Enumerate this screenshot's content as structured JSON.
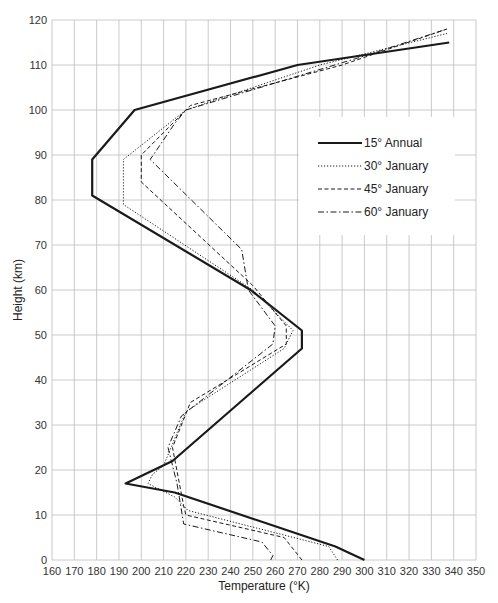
{
  "chart_data": {
    "type": "line",
    "title": "",
    "xlabel": "Temperature (°K)",
    "ylabel": "Height (km)",
    "xlim": [
      160,
      350
    ],
    "ylim": [
      0,
      120
    ],
    "x_ticks": [
      160,
      170,
      180,
      190,
      200,
      210,
      220,
      230,
      240,
      250,
      260,
      270,
      280,
      290,
      300,
      310,
      320,
      330,
      340,
      350
    ],
    "y_ticks": [
      0,
      10,
      20,
      30,
      40,
      50,
      60,
      70,
      80,
      90,
      100,
      110,
      120
    ],
    "grid": true,
    "legend_position": "upper right (inside plot, ~x 250–345, y 72–118 km)",
    "series": [
      {
        "name": "15° Annual",
        "style": "solid-thick",
        "points": [
          [
            300,
            0
          ],
          [
            287,
            3
          ],
          [
            215,
            15
          ],
          [
            193,
            17
          ],
          [
            214,
            22
          ],
          [
            272,
            47
          ],
          [
            272,
            51
          ],
          [
            249,
            60
          ],
          [
            178,
            81
          ],
          [
            178,
            89
          ],
          [
            197,
            100
          ],
          [
            270,
            110
          ],
          [
            338,
            115
          ]
        ]
      },
      {
        "name": "30° January",
        "style": "dotted",
        "points": [
          [
            288,
            0
          ],
          [
            284,
            3
          ],
          [
            221,
            11
          ],
          [
            215,
            14
          ],
          [
            203,
            17
          ],
          [
            205,
            19
          ],
          [
            210,
            21
          ],
          [
            220,
            33
          ],
          [
            264,
            47
          ],
          [
            268,
            51
          ],
          [
            250,
            60
          ],
          [
            192,
            79
          ],
          [
            192,
            89
          ],
          [
            220,
            100
          ],
          [
            280,
            110
          ],
          [
            337,
            117
          ]
        ]
      },
      {
        "name": "45° January",
        "style": "dashed",
        "points": [
          [
            272,
            0
          ],
          [
            264,
            5
          ],
          [
            220,
            10
          ],
          [
            219,
            12
          ],
          [
            214,
            25
          ],
          [
            222,
            35
          ],
          [
            265,
            48
          ],
          [
            265,
            52
          ],
          [
            250,
            61
          ],
          [
            200,
            84
          ],
          [
            200,
            90
          ],
          [
            222,
            101
          ],
          [
            290,
            110
          ],
          [
            337,
            118
          ]
        ]
      },
      {
        "name": "60° January",
        "style": "dash-dot",
        "points": [
          [
            258,
            0
          ],
          [
            259,
            1
          ],
          [
            254,
            4
          ],
          [
            219,
            8
          ],
          [
            216,
            17
          ],
          [
            212,
            25
          ],
          [
            218,
            32
          ],
          [
            259,
            48
          ],
          [
            260,
            52
          ],
          [
            248,
            60
          ],
          [
            245,
            69
          ],
          [
            204,
            89
          ],
          [
            215,
            97
          ],
          [
            220,
            100
          ],
          [
            300,
            112
          ],
          [
            337,
            118
          ]
        ]
      }
    ]
  },
  "legend": {
    "items": [
      {
        "label": "15° Annual",
        "style": "solid-thick"
      },
      {
        "label": "30° January",
        "style": "dotted"
      },
      {
        "label": "45° January",
        "style": "dashed"
      },
      {
        "label": "60° January",
        "style": "dash-dot"
      }
    ]
  },
  "axes": {
    "x_title": "Temperature (°K)",
    "y_title": "Height (km)"
  },
  "colors": {
    "grid": "#bdbdbd",
    "line": "#1a1a1a",
    "background": "#ffffff"
  }
}
